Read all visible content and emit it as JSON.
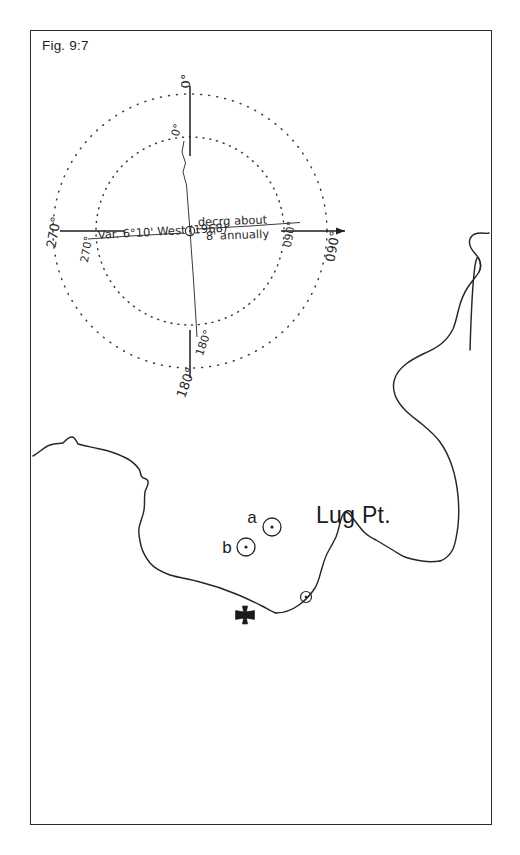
{
  "figure": {
    "label": "Fig. 9:7",
    "kind": "hand-drawn nautical chart extract",
    "frame_color": "#2b2b2b",
    "ink_color": "#2a2a2a",
    "background": "#ffffff"
  },
  "compass_rose": {
    "name": "compass-rose",
    "center": {
      "x": 190,
      "y": 231
    },
    "outer_ring_radius": 137,
    "inner_ring_radius": 94,
    "ring_style": "dotted",
    "true_north_label": "0°",
    "magnetic_north_label": "0°",
    "true_south_label": "180°",
    "magnetic_south_label": "180°",
    "true_east_label": "090°",
    "magnetic_east_label": "090°",
    "true_west_label": "270°",
    "magnetic_west_label": "270°",
    "variation_text_line1": "Var. 6°10' West (1968)",
    "variation_text_line2": "decrg  about",
    "variation_text_line3": "8'  annually",
    "variation_degrees": 6,
    "variation_minutes": 10,
    "variation_direction": "West",
    "variation_epoch_year": 1968,
    "annual_change_minutes": 8,
    "annual_change_sense": "decreasing"
  },
  "map": {
    "name": "coastline-map",
    "headland_label": "Lug Pt.",
    "markers": [
      {
        "id": "a",
        "label": "a",
        "symbol": "circle-dot",
        "x": 272,
        "y": 527,
        "radius": 9
      },
      {
        "id": "b",
        "label": "b",
        "symbol": "circle-dot",
        "x": 246,
        "y": 547,
        "radius": 9
      },
      {
        "id": "c",
        "label": "",
        "symbol": "circle-dot",
        "x": 306,
        "y": 597,
        "radius": 5.5
      }
    ],
    "church_symbol": {
      "name": "church-cross-symbol",
      "x": 245,
      "y": 615
    }
  }
}
